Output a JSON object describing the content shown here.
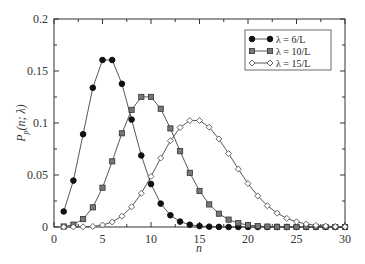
{
  "chart_data": {
    "type": "line",
    "title": "",
    "xlabel": "n",
    "ylabel": "P_p(n; λ)",
    "xlim": [
      0,
      30
    ],
    "ylim": [
      0,
      0.2
    ],
    "xticks": [
      "0",
      "5",
      "10",
      "15",
      "20",
      "25",
      "30"
    ],
    "yticks": [
      "0",
      "0.05",
      "0.1",
      "0.15",
      "0.2"
    ],
    "grid": false,
    "legend_position": "upper right",
    "x": [
      1,
      2,
      3,
      4,
      5,
      6,
      7,
      8,
      9,
      10,
      11,
      12,
      13,
      14,
      15,
      16,
      17,
      18,
      19,
      20,
      21,
      22,
      23,
      24,
      25,
      26,
      27,
      28,
      29,
      30
    ],
    "series": [
      {
        "name": "λ = 6/L",
        "marker": "filled-circle",
        "values": [
          0.0149,
          0.0446,
          0.0892,
          0.1339,
          0.1606,
          0.1606,
          0.1377,
          0.1033,
          0.0688,
          0.0413,
          0.0225,
          0.0113,
          0.0052,
          0.0022,
          0.0009,
          0.0003,
          0.0001,
          0,
          0,
          0,
          0,
          0,
          0,
          0,
          0,
          0,
          0,
          0,
          0,
          0
        ]
      },
      {
        "name": "λ = 10/L",
        "marker": "square",
        "values": [
          0.0005,
          0.0023,
          0.0076,
          0.0189,
          0.0378,
          0.0631,
          0.0901,
          0.1126,
          0.1251,
          0.1251,
          0.1137,
          0.0948,
          0.0729,
          0.0521,
          0.0347,
          0.0217,
          0.0128,
          0.0071,
          0.0037,
          0.0019,
          0.0009,
          0.0004,
          0.0002,
          0.0001,
          0,
          0,
          0,
          0,
          0,
          0
        ]
      },
      {
        "name": "λ = 15/L",
        "marker": "open-diamond",
        "values": [
          0,
          0,
          0.0002,
          0.0006,
          0.0019,
          0.0048,
          0.0104,
          0.0194,
          0.0324,
          0.0486,
          0.0663,
          0.0829,
          0.0956,
          0.1024,
          0.1024,
          0.096,
          0.0847,
          0.0706,
          0.0557,
          0.0418,
          0.0299,
          0.0204,
          0.0133,
          0.0083,
          0.005,
          0.0029,
          0.0016,
          0.0009,
          0.0004,
          0.0002
        ]
      }
    ]
  },
  "legend": {
    "items": [
      "λ = 6/L",
      "λ = 10/L",
      "λ = 15/L"
    ]
  },
  "axes": {
    "xlabel": "n",
    "ylabel_main": "P",
    "ylabel_sub": "p",
    "ylabel_rest": "(n; λ)"
  }
}
